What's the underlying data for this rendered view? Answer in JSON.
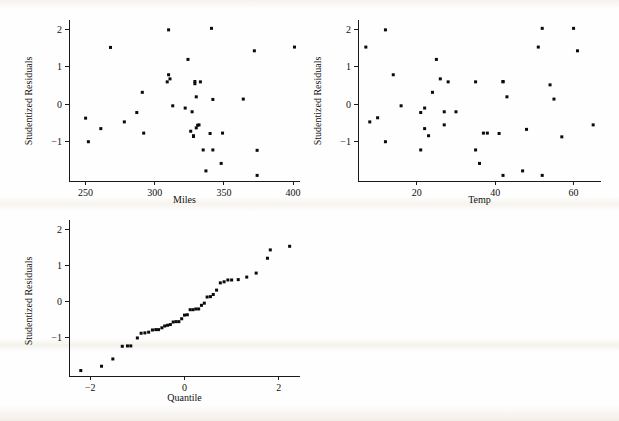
{
  "figure": {
    "kind": "residual-diagnostic-panel",
    "panel_count": 3,
    "background_color": "#fefefe",
    "point_color": "#0a0a0a",
    "axis_color": "#1a1a1a"
  },
  "chart_data": [
    {
      "id": "residuals-vs-miles",
      "type": "scatter",
      "title": "",
      "xlabel": "Miles",
      "ylabel": "Studentized Residuals",
      "xlim": [
        238,
        405
      ],
      "ylim": [
        -2.05,
        2.2
      ],
      "xticks": [
        250,
        300,
        350,
        400
      ],
      "yticks": [
        -1,
        0,
        1,
        2
      ],
      "xticklabels": [
        "250",
        "300",
        "350",
        "400"
      ],
      "yticklabels": [
        "-1",
        "0",
        "1",
        "2"
      ],
      "grid": false,
      "legend": "none",
      "x": [
        250,
        252,
        261,
        268,
        278,
        287,
        291,
        292,
        309,
        310,
        310,
        311,
        313,
        322,
        324,
        326,
        327,
        328,
        328,
        329,
        329,
        330,
        330,
        331,
        332,
        333,
        335,
        337,
        340,
        341,
        342,
        342,
        348,
        349,
        364,
        372,
        374,
        374,
        401
      ],
      "y": [
        -0.37,
        -1.0,
        -0.65,
        1.52,
        -0.47,
        -0.22,
        0.32,
        -0.77,
        0.6,
        1.99,
        0.79,
        0.68,
        -0.04,
        -0.1,
        1.2,
        -0.72,
        -0.2,
        -0.86,
        -0.84,
        0.61,
        0.55,
        -0.63,
        0.2,
        -0.56,
        -0.55,
        0.6,
        -1.22,
        -1.78,
        -0.78,
        2.03,
        0.13,
        -1.22,
        -1.58,
        -0.77,
        0.14,
        1.43,
        -1.23,
        -1.9,
        1.53
      ],
      "marker": "square",
      "marker_size": 3
    },
    {
      "id": "residuals-vs-temp",
      "type": "scatter",
      "title": "",
      "xlabel": "Temp",
      "ylabel": "Studentized Residuals",
      "xlim": [
        5,
        67
      ],
      "ylim": [
        -2.05,
        2.2
      ],
      "xticks": [
        20,
        40,
        60
      ],
      "yticks": [
        -1,
        0,
        1,
        2
      ],
      "xticklabels": [
        "20",
        "40",
        "60"
      ],
      "yticklabels": [
        "-1",
        "0",
        "1",
        "2"
      ],
      "grid": false,
      "legend": "none",
      "x": [
        7,
        8,
        10,
        12,
        12,
        14,
        16,
        21,
        21,
        22,
        22,
        23,
        24,
        25,
        26,
        27,
        27,
        28,
        30,
        35,
        35,
        36,
        37,
        38,
        41,
        42,
        42,
        42,
        43,
        47,
        48,
        51,
        52,
        52,
        54,
        55,
        57,
        60,
        61,
        65
      ],
      "y": [
        1.53,
        -0.47,
        -0.36,
        1.99,
        -1.0,
        0.79,
        -0.04,
        -0.22,
        -1.22,
        -0.1,
        -0.65,
        -0.84,
        0.32,
        1.2,
        0.68,
        -0.55,
        -0.2,
        0.6,
        -0.2,
        0.6,
        -1.22,
        -1.58,
        -0.77,
        -0.77,
        -0.78,
        0.61,
        0.6,
        -1.9,
        0.2,
        -1.78,
        -0.67,
        1.53,
        2.03,
        -1.9,
        0.52,
        0.14,
        -0.87,
        2.03,
        1.43,
        -0.55
      ],
      "marker": "square",
      "marker_size": 3
    },
    {
      "id": "normal-quantile-plot",
      "type": "scatter",
      "title": "",
      "xlabel": "Quantile",
      "ylabel": "Studentized Residuals",
      "xlim": [
        -2.45,
        2.45
      ],
      "ylim": [
        -2.05,
        2.2
      ],
      "xticks": [
        -2,
        0,
        2
      ],
      "yticks": [
        -1,
        0,
        1,
        2
      ],
      "xticklabels": [
        "-2",
        "0",
        "2"
      ],
      "yticklabels": [
        "-1",
        "0",
        "1",
        "2"
      ],
      "grid": false,
      "legend": "none",
      "x": [
        -2.2,
        -1.76,
        -1.52,
        -1.32,
        -1.21,
        -1.14,
        -1.0,
        -0.92,
        -0.84,
        -0.76,
        -0.68,
        -0.61,
        -0.55,
        -0.48,
        -0.42,
        -0.36,
        -0.3,
        -0.24,
        -0.18,
        -0.12,
        -0.06,
        0.0,
        0.06,
        0.12,
        0.18,
        0.24,
        0.3,
        0.36,
        0.42,
        0.48,
        0.55,
        0.61,
        0.68,
        0.76,
        0.84,
        0.92,
        1.0,
        1.14,
        1.32,
        1.52,
        1.76,
        1.82,
        2.23
      ],
      "y": [
        -1.9,
        -1.78,
        -1.58,
        -1.23,
        -1.22,
        -1.22,
        -1.0,
        -0.87,
        -0.86,
        -0.84,
        -0.78,
        -0.77,
        -0.77,
        -0.72,
        -0.67,
        -0.65,
        -0.63,
        -0.56,
        -0.55,
        -0.55,
        -0.47,
        -0.37,
        -0.36,
        -0.22,
        -0.22,
        -0.2,
        -0.2,
        -0.1,
        -0.04,
        0.13,
        0.14,
        0.2,
        0.32,
        0.52,
        0.55,
        0.6,
        0.6,
        0.61,
        0.68,
        0.79,
        1.2,
        1.43,
        1.53,
        1.53,
        1.99,
        2.03
      ],
      "marker": "square",
      "marker_size": 3
    }
  ]
}
